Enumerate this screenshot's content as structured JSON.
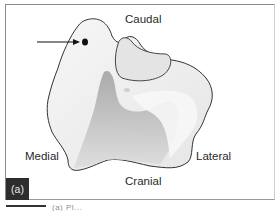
{
  "figure": {
    "panel_label": "(a)",
    "labels": {
      "top": "Caudal",
      "bottom": "Cranial",
      "left": "Medial",
      "right": "Lateral"
    },
    "annotations": [
      {
        "type": "arrow",
        "points_to": "dot-marker"
      },
      {
        "type": "dot",
        "name": "dot-marker"
      }
    ],
    "caption_partial": "(a) Pl...",
    "colors": {
      "outline": "#333333",
      "shade_dark": "#a9a9a9",
      "shade_mid": "#d6d6d6",
      "shade_light": "#f2f2f2",
      "panel_bg": "#2d2d2d",
      "frame": "#8a8a8a"
    }
  }
}
